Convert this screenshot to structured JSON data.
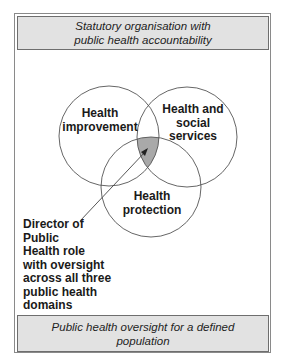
{
  "header_banner": {
    "lines": [
      "Statutory organisation with",
      "public health accountability"
    ]
  },
  "footer_banner": {
    "lines": [
      "Public health oversight for a defined",
      "population"
    ]
  },
  "venn": {
    "circles": [
      {
        "id": "health-improvement",
        "lines": [
          "Health",
          "improvement"
        ]
      },
      {
        "id": "health-and-social-services",
        "lines": [
          "Health and",
          "social",
          "services"
        ]
      },
      {
        "id": "health-protection",
        "lines": [
          "Health",
          "protection"
        ]
      }
    ],
    "intersection_fill": "#a9a9a9",
    "stroke_color": "#555555"
  },
  "callout": {
    "lines": [
      "Director of",
      "Public",
      "Health role",
      "with oversight",
      "across all three",
      "public health",
      "domains"
    ]
  }
}
